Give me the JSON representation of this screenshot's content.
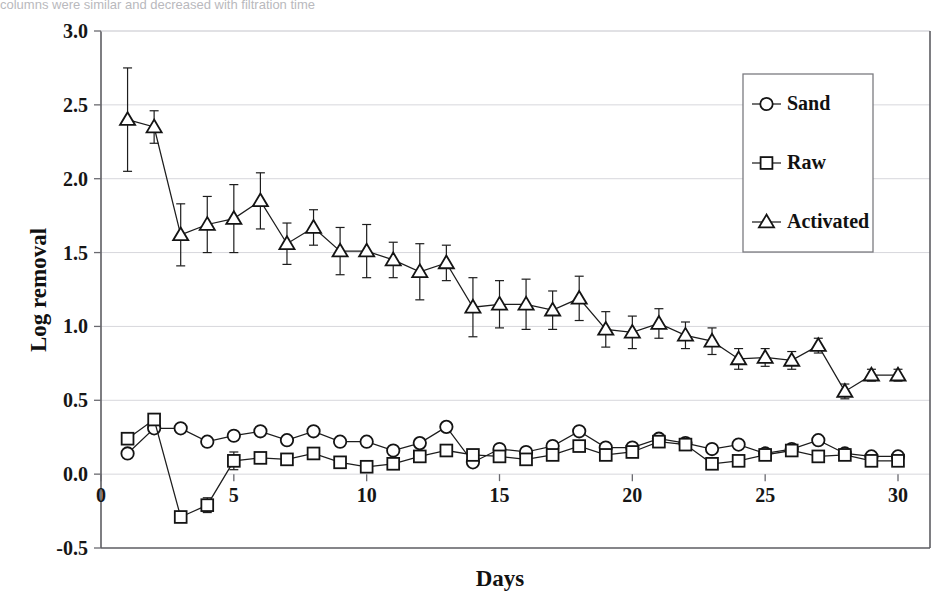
{
  "caption": {
    "text": "columns were similar and decreased with filtration time"
  },
  "chart_data": {
    "type": "line",
    "title": "",
    "xlabel": "Days",
    "ylabel": "Log removal",
    "xlim": [
      0,
      30
    ],
    "ylim": [
      -0.5,
      3.0
    ],
    "xticks": [
      0,
      5,
      10,
      15,
      20,
      25,
      30
    ],
    "xtick_labels": [
      "0",
      "5",
      "10",
      "15",
      "20",
      "25",
      "30"
    ],
    "yticks": [
      -0.5,
      0.0,
      0.5,
      1.0,
      1.5,
      2.0,
      2.5,
      3.0
    ],
    "ytick_labels": [
      "-0.5",
      "0.0",
      "0.5",
      "1.0",
      "1.5",
      "2.0",
      "2.5",
      "3.0"
    ],
    "grid": "horizontal",
    "legend_position": "top-right",
    "x": [
      1,
      2,
      3,
      4,
      5,
      6,
      7,
      8,
      9,
      10,
      11,
      12,
      13,
      14,
      15,
      16,
      17,
      18,
      19,
      20,
      21,
      22,
      23,
      24,
      25,
      26,
      27,
      28,
      29,
      30
    ],
    "series": [
      {
        "name": "Sand",
        "marker": "circle",
        "values": [
          0.14,
          0.31,
          0.31,
          0.22,
          0.26,
          0.29,
          0.23,
          0.29,
          0.22,
          0.22,
          0.16,
          0.21,
          0.32,
          0.08,
          0.17,
          0.15,
          0.19,
          0.29,
          0.18,
          0.18,
          0.24,
          0.21,
          0.17,
          0.2,
          0.14,
          0.17,
          0.23,
          0.14,
          0.12,
          0.12
        ],
        "errors": [
          0,
          0,
          0,
          0,
          0,
          0,
          0,
          0,
          0,
          0,
          0,
          0,
          0,
          0,
          0,
          0,
          0,
          0,
          0,
          0,
          0,
          0,
          0,
          0,
          0,
          0,
          0,
          0,
          0,
          0
        ]
      },
      {
        "name": "Raw",
        "marker": "square",
        "values": [
          0.24,
          0.37,
          -0.29,
          -0.21,
          0.09,
          0.11,
          0.1,
          0.14,
          0.08,
          0.05,
          0.07,
          0.12,
          0.16,
          0.13,
          0.12,
          0.1,
          0.13,
          0.19,
          0.13,
          0.15,
          0.22,
          0.2,
          0.07,
          0.09,
          0.13,
          0.16,
          0.12,
          0.13,
          0.09,
          0.09
        ],
        "errors": [
          0,
          0,
          0,
          0.05,
          0.06,
          0,
          0,
          0,
          0,
          0,
          0,
          0,
          0,
          0,
          0,
          0,
          0,
          0,
          0,
          0,
          0,
          0,
          0,
          0,
          0,
          0,
          0,
          0,
          0,
          0
        ]
      },
      {
        "name": "Activated",
        "marker": "triangle",
        "values": [
          2.4,
          2.35,
          1.62,
          1.69,
          1.73,
          1.85,
          1.56,
          1.67,
          1.51,
          1.51,
          1.45,
          1.37,
          1.43,
          1.13,
          1.15,
          1.15,
          1.11,
          1.19,
          0.98,
          0.96,
          1.02,
          0.94,
          0.9,
          0.78,
          0.79,
          0.77,
          0.87,
          0.56,
          0.67,
          0.67
        ],
        "errors": [
          0.35,
          0.11,
          0.21,
          0.19,
          0.23,
          0.19,
          0.14,
          0.12,
          0.16,
          0.18,
          0.12,
          0.19,
          0.12,
          0.2,
          0.16,
          0.17,
          0.13,
          0.15,
          0.12,
          0.11,
          0.1,
          0.09,
          0.09,
          0.07,
          0.06,
          0.06,
          0.05,
          0.05,
          0.04,
          0.04
        ]
      }
    ]
  },
  "legend": {
    "entries": [
      {
        "label": "Sand",
        "marker": "circle"
      },
      {
        "label": "Raw",
        "marker": "square"
      },
      {
        "label": "Activated",
        "marker": "triangle"
      }
    ]
  }
}
